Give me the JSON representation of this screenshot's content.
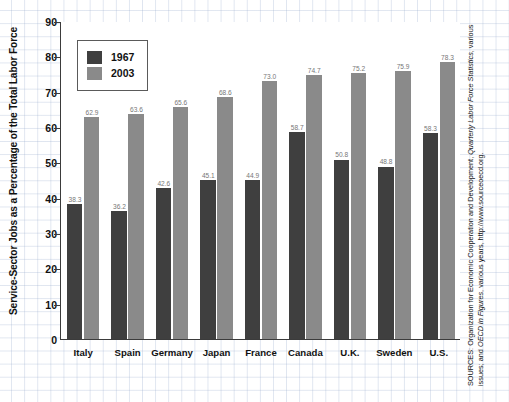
{
  "chart_data": {
    "type": "bar",
    "title": "",
    "xlabel": "",
    "ylabel": "Service-Sector Jobs as a Percentage of the Total Labor Force",
    "ylim": [
      0,
      90
    ],
    "yticks": [
      0,
      10,
      20,
      30,
      40,
      50,
      60,
      70,
      80,
      90
    ],
    "grid": true,
    "legend_position": "upper-left",
    "categories": [
      "Italy",
      "Spain",
      "Germany",
      "Japan",
      "France",
      "Canada",
      "U.K.",
      "Sweden",
      "U.S."
    ],
    "series": [
      {
        "name": "1967",
        "color": "#3f3f3f",
        "values": [
          38.3,
          36.2,
          42.6,
          45.1,
          44.9,
          58.7,
          50.8,
          48.8,
          58.3
        ]
      },
      {
        "name": "2003",
        "color": "#8a8a8a",
        "values": [
          62.9,
          63.6,
          65.6,
          68.6,
          73.0,
          74.7,
          75.2,
          75.9,
          78.3
        ]
      }
    ]
  },
  "legend": {
    "items": [
      {
        "label": "1967",
        "color": "#3f3f3f"
      },
      {
        "label": "2003",
        "color": "#8a8a8a"
      }
    ]
  },
  "source": {
    "prefix": "SOURCES:",
    "line": "SOURCES: Organization for Economic Cooperation and Development, Quarterly Labor Force Statistics, various issues; and OECD in Figures, various years, http://www.sourceoecd.org.",
    "part1": "SOURCES: Organization for Economic Cooperation and Development, ",
    "italic1": "Quarterly Labor Force Statistics",
    "part2": ", various issues; and ",
    "italic2": "OECD in Figures",
    "part3": ", various years, http://www.sourceoecd.org."
  }
}
